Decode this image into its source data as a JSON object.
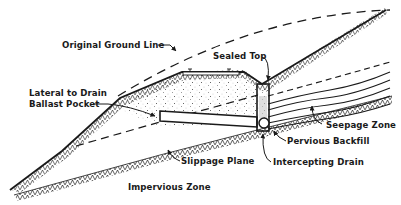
{
  "diagram": {
    "labels": {
      "original_ground_line": "Original Ground Line",
      "sealed_top": "Sealed Top",
      "lateral_to_drain": "Lateral to Drain",
      "ballast_pocket": "Ballast Pocket",
      "seepage_zone": "Seepage Zone",
      "pervious_backfill": "Pervious Backfill",
      "slippage_plane": "Slippage Plane",
      "intercepting_drain": "Intercepting Drain",
      "impervious_zone": "Impervious Zone"
    },
    "colors": {
      "ink": "#1a1a1a",
      "background": "#ffffff"
    }
  }
}
